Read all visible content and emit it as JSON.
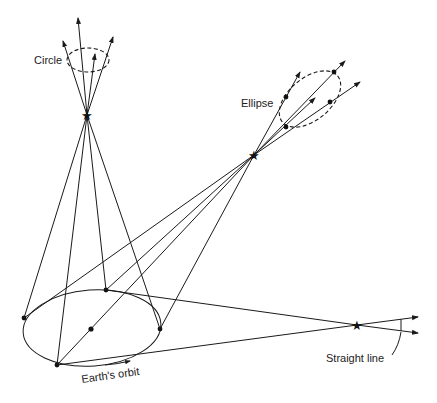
{
  "diagram": {
    "labels": {
      "circle": "Circle",
      "ellipse": "Ellipse",
      "straight_line": "Straight line",
      "earths_orbit": "Earth's orbit"
    },
    "colors": {
      "ink": "#1a1a1a",
      "background": "#ffffff"
    }
  }
}
